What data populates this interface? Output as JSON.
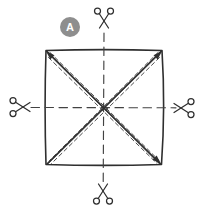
{
  "theme": {
    "canvas-bg": "#ffffff",
    "ink": "#2f2f2f",
    "crease": "#424242",
    "stipple-dot": "#c7c7c7",
    "stipple-dot-light": "#d8d8d8",
    "badge-bg": "#8e8e8e",
    "badge-fg": "#ffffff"
  },
  "step_badge": {
    "label": "A"
  },
  "icons": {
    "scissors": "✂"
  },
  "diagram": {
    "shape": "square",
    "fold_lines": [
      "diagonal-top-left-to-bottom-right",
      "diagonal-top-right-to-bottom-left"
    ],
    "cut_lines": [
      "vertical-center",
      "horizontal-center"
    ],
    "scissors_positions": [
      "top",
      "left",
      "right",
      "bottom"
    ]
  }
}
